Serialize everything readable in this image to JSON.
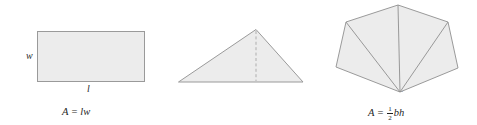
{
  "figure": {
    "background_color": "#ffffff",
    "shape_fill_color": "#ececec",
    "shape_stroke_color": "#9a9a9a",
    "text_color": "#1f1f1f"
  },
  "panels": [
    {
      "id": "rectangle",
      "shape": "rectangle",
      "labels": {
        "width": "w",
        "length": "l"
      },
      "formula": {
        "lhs": "A",
        "equals": "=",
        "rhs": "lw",
        "plain": "A = lw"
      },
      "geometry": {
        "x": 37,
        "y": 31,
        "width": 108,
        "height": 51
      }
    },
    {
      "id": "triangle",
      "shape": "triangle",
      "labels": {
        "height": "h",
        "base": "b"
      },
      "formula": {
        "lhs": "A",
        "equals": "=",
        "fraction_numerator": "1",
        "fraction_denominator": "2",
        "rhs": "bh",
        "plain": "A = 1/2 bh"
      },
      "geometry": {
        "apex_x": 256,
        "apex_y": 29,
        "base_left_x": 178,
        "base_right_x": 303,
        "base_y": 82
      }
    },
    {
      "id": "polygon",
      "shape": "pentagon-subdivided",
      "labels": {
        "region_1": "A",
        "region_1_sub": "1",
        "region_2": "A",
        "region_2_sub": "2",
        "region_3": "A",
        "region_3_sub": "3",
        "region_4": "A",
        "region_4_sub": "4"
      },
      "formula": {
        "lhs": "A",
        "equals": "=",
        "terms": [
          "A",
          "A",
          "A",
          "A"
        ],
        "subscripts": [
          "1",
          "2",
          "3",
          "4"
        ],
        "operator": "+",
        "plain": "A = A1 + A2 + A3 + A4"
      },
      "geometry": {
        "vertices": [
          {
            "name": "top",
            "x": 398,
            "y": 5
          },
          {
            "name": "upper-right",
            "x": 448,
            "y": 22
          },
          {
            "name": "lower-right",
            "x": 458,
            "y": 68
          },
          {
            "name": "bottom-apex",
            "x": 400,
            "y": 92
          },
          {
            "name": "lower-left",
            "x": 336,
            "y": 67
          },
          {
            "name": "upper-left",
            "x": 346,
            "y": 22
          }
        ],
        "subdivision_count": 4
      }
    }
  ]
}
